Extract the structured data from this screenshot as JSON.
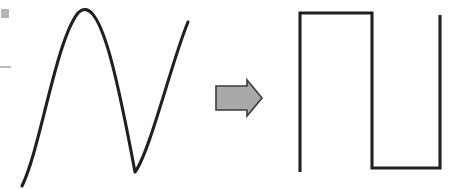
{
  "diagram": {
    "background_color": "#ffffff",
    "width": 460,
    "height": 189
  },
  "input_waveform": {
    "name": "smooth-sine-curve",
    "description": "Smooth continuous analog wave rising to a peak, falling to a trough, then rising again",
    "stroke_color": "#231f20",
    "stroke_width": 3.1,
    "path": "M 22 186 C 40 150 56 40 78 13 C 99 -8 116 70 135 172 C 150 152 172 60 188 22",
    "key_points": {
      "start": [
        22,
        186
      ],
      "peak": [
        78,
        13
      ],
      "trough": [
        135,
        172
      ],
      "end": [
        188,
        22
      ]
    }
  },
  "arrow": {
    "name": "right-arrow",
    "label": "converts to",
    "fill_color": "#a9a9a9",
    "stroke_color": "#3a3a3a",
    "points": "216,86 247,86 247,80 262,98 247,116 247,110 216,110",
    "direction": "right"
  },
  "output_waveform": {
    "name": "square-wave",
    "description": "Digital square wave with a high plateau, falling edge, low plateau and final rising edge",
    "stroke_color": "#231f20",
    "stroke_width": 3.1,
    "path": "M 300 172 L 300 13 L 372 13 L 372 168 L 440 168 L 440 15",
    "key_points": {
      "rise_start": [
        300,
        172
      ],
      "high_left": [
        300,
        13
      ],
      "high_right": [
        372,
        13
      ],
      "low_left": [
        372,
        168
      ],
      "low_right": [
        440,
        168
      ],
      "final_top": [
        440,
        15
      ]
    }
  },
  "artifacts": [
    {
      "name": "edge-mark-square",
      "x": 1,
      "y": 9,
      "width": 8,
      "height": 9,
      "color": "#b4b4b4"
    },
    {
      "name": "edge-mark-dash",
      "x": 0,
      "y": 66,
      "width": 11,
      "height": 2,
      "color": "#bcbcbc"
    }
  ]
}
